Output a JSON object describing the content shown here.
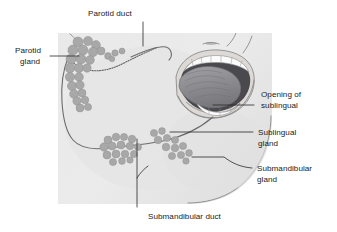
{
  "figure": {
    "background_color": "#ffffff",
    "face_fill": "#ededed",
    "gland_color": "#a8a8a8",
    "tongue_color": "#8f8f93",
    "oral_cavity_color": "#4a4a4e",
    "teeth_color": "#fbfbfb",
    "label_color": "#1a1a1a",
    "leader_color": "#2a2a2a"
  },
  "labels": {
    "parotid_duct": "Parotid duct",
    "parotid_gland_line1": "Parotid",
    "parotid_gland_line2": "gland",
    "opening_sublingual_line1": "Opening of",
    "opening_sublingual_line2": "sublingual",
    "sublingual_gland_line1": "Sublingual",
    "sublingual_gland_line2": "gland",
    "submandibular_gland_line1": "Submandibular",
    "submandibular_gland_line2": "gland",
    "submandibular_duct": "Submandibular duct"
  },
  "structures": {
    "parotid_gland": "parotid-gland",
    "parotid_duct": "parotid-duct",
    "sublingual_gland": "sublingual-gland",
    "submandibular_gland": "submandibular-gland",
    "submandibular_duct": "submandibular-duct",
    "sublingual_opening": "sublingual-opening",
    "tongue": "tongue",
    "upper_teeth": "upper-teeth",
    "lower_teeth": "lower-teeth",
    "ear": "ear",
    "nose": "nose",
    "face": "face-profile"
  }
}
